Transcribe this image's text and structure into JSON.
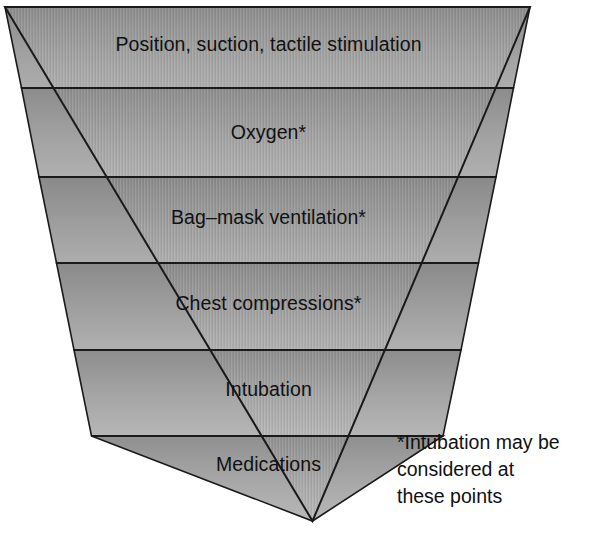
{
  "diagram": {
    "type": "inverted-pyramid",
    "background_color": "#ffffff",
    "outline_color": "#1a1a1a",
    "text_color": "#111111",
    "band_fill_top": "#8e8e8e",
    "band_fill_bottom": "#b4b4b4",
    "bands": [
      {
        "index": 1,
        "label": "Position, suction, tactile stimulation",
        "has_asterisk": false
      },
      {
        "index": 2,
        "label": "Oxygen*",
        "has_asterisk": true
      },
      {
        "index": 3,
        "label": "Bag–mask ventilation*",
        "has_asterisk": true
      },
      {
        "index": 4,
        "label": "Chest compressions*",
        "has_asterisk": true
      },
      {
        "index": 5,
        "label": "Intubation",
        "has_asterisk": false
      },
      {
        "index": 6,
        "label": "Medications",
        "has_asterisk": false
      }
    ],
    "footnote": {
      "lines": [
        "*Intubation may be",
        "considered at",
        "these points"
      ]
    }
  }
}
